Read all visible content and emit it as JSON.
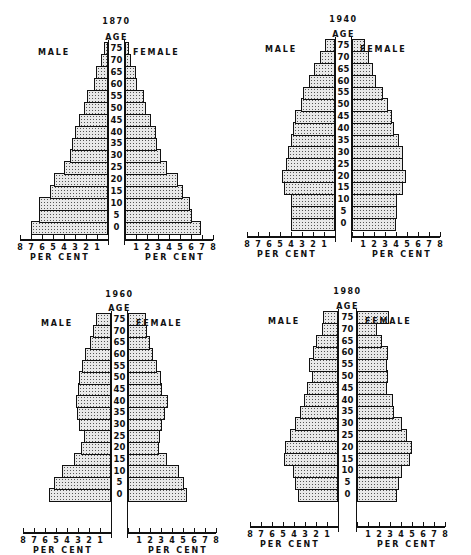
{
  "chart_data": [
    {
      "type": "bar",
      "subtype": "population-pyramid",
      "title": "1870",
      "age_header": "AGE",
      "left_label": "MALE",
      "right_label": "FEMALE",
      "xlabel": "PER CENT",
      "xlim": [
        0,
        8
      ],
      "age_groups": [
        "0",
        "5",
        "10",
        "15",
        "20",
        "25",
        "30",
        "35",
        "40",
        "45",
        "50",
        "55",
        "60",
        "65",
        "70",
        "75"
      ],
      "series": [
        {
          "name": "MALE",
          "values": [
            7.0,
            6.3,
            6.3,
            5.3,
            4.9,
            4.0,
            3.5,
            3.3,
            3.0,
            2.6,
            2.2,
            1.9,
            1.3,
            1.1,
            0.6,
            0.4
          ]
        },
        {
          "name": "FEMALE",
          "values": [
            6.9,
            6.1,
            5.9,
            5.3,
            4.8,
            3.8,
            3.3,
            2.9,
            2.8,
            2.4,
            1.9,
            1.7,
            1.1,
            1.0,
            0.5,
            0.4
          ]
        }
      ]
    },
    {
      "type": "bar",
      "subtype": "population-pyramid",
      "title": "1940",
      "age_header": "AGE",
      "left_label": "MALE",
      "right_label": "FEMALE",
      "xlabel": "PER CENT",
      "xlim": [
        0,
        8
      ],
      "age_groups": [
        "0",
        "5",
        "10",
        "15",
        "20",
        "25",
        "30",
        "35",
        "40",
        "45",
        "50",
        "55",
        "60",
        "65",
        "70",
        "75"
      ],
      "series": [
        {
          "name": "MALE",
          "values": [
            4.0,
            4.0,
            4.0,
            4.6,
            4.8,
            4.5,
            4.3,
            4.0,
            3.8,
            3.6,
            3.1,
            2.9,
            2.4,
            1.9,
            1.4,
            0.9
          ]
        },
        {
          "name": "FEMALE",
          "values": [
            4.0,
            4.1,
            4.1,
            4.6,
            4.9,
            4.6,
            4.6,
            4.3,
            3.8,
            3.6,
            3.3,
            2.8,
            2.2,
            1.9,
            1.5,
            1.2
          ]
        }
      ]
    },
    {
      "type": "bar",
      "subtype": "population-pyramid",
      "title": "1960",
      "age_header": "AGE",
      "left_label": "MALE",
      "right_label": "FEMALE",
      "xlabel": "PER CENT",
      "xlim": [
        0,
        8
      ],
      "age_groups": [
        "0",
        "5",
        "10",
        "15",
        "20",
        "25",
        "30",
        "35",
        "40",
        "45",
        "50",
        "55",
        "60",
        "65",
        "70",
        "75"
      ],
      "series": [
        {
          "name": "MALE",
          "values": [
            5.6,
            5.2,
            4.5,
            3.4,
            2.7,
            2.5,
            2.9,
            3.1,
            3.2,
            3.0,
            2.9,
            2.6,
            2.4,
            1.9,
            1.6,
            1.4
          ]
        },
        {
          "name": "FEMALE",
          "values": [
            5.4,
            5.1,
            4.6,
            3.5,
            2.8,
            2.9,
            3.1,
            3.4,
            3.6,
            3.1,
            3.0,
            2.6,
            2.3,
            2.0,
            1.7,
            1.6
          ]
        }
      ]
    },
    {
      "type": "bar",
      "subtype": "population-pyramid",
      "title": "1980",
      "age_header": "AGE",
      "left_label": "MALE",
      "right_label": "FEMALE",
      "xlabel": "PER CENT",
      "xlim": [
        0,
        8
      ],
      "age_groups": [
        "0",
        "5",
        "10",
        "15",
        "20",
        "25",
        "30",
        "35",
        "40",
        "45",
        "50",
        "55",
        "60",
        "65",
        "70",
        "75"
      ],
      "series": [
        {
          "name": "MALE",
          "values": [
            3.6,
            3.9,
            4.1,
            4.9,
            4.8,
            4.4,
            3.9,
            3.5,
            3.1,
            2.8,
            2.4,
            2.6,
            2.3,
            2.0,
            1.5,
            1.4
          ]
        },
        {
          "name": "FEMALE",
          "values": [
            3.6,
            3.8,
            4.1,
            4.8,
            5.0,
            4.5,
            4.1,
            3.4,
            3.3,
            2.7,
            2.8,
            2.7,
            2.8,
            2.3,
            1.8,
            2.9
          ]
        }
      ]
    }
  ],
  "axis": {
    "left_ticks": [
      "8",
      "7",
      "6",
      "5",
      "4",
      "3",
      "2",
      "1"
    ],
    "right_ticks": [
      "1",
      "2",
      "3",
      "4",
      "5",
      "6",
      "7",
      "8"
    ]
  }
}
